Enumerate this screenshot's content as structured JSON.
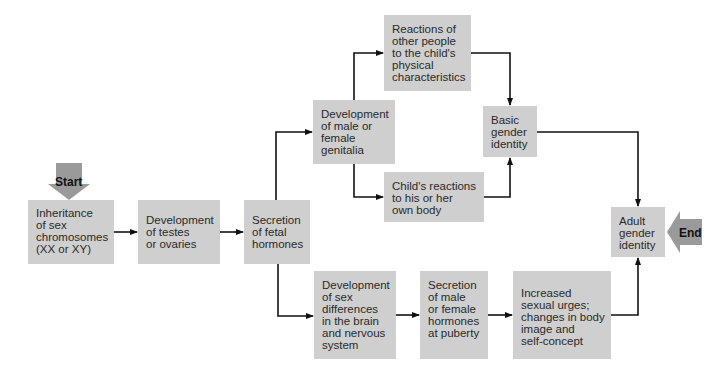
{
  "diagram": {
    "start_label": "Start",
    "end_label": "End",
    "colors": {
      "box_fill": "#cfcfcf",
      "arrow_fill": "#9a9a9a",
      "line": "#111111"
    },
    "nodes": {
      "inheritance": "Inheritance\nof sex\nchromosomes\n(XX or XY)",
      "testes_ovaries": "Development\nof testes\nor ovaries",
      "fetal_hormones": "Secretion\nof  fetal\nhormones",
      "genitalia": "Development\nof male or\nfemale\ngenitalia",
      "reactions_others": "Reactions of\nother people\nto the child's\nphysical\ncharacteristics",
      "child_reactions": "Child's reactions\nto his or her\nown body",
      "basic_identity": "Basic\ngender\nidentity",
      "adult_identity": "Adult\ngender\nidentity",
      "brain_differences": "Development\nof sex\ndifferences\nin the brain\nand nervous\nsystem",
      "puberty_hormones": "Secretion\nof male\nor female\nhormones\nat puberty",
      "sexual_urges": "Increased\nsexual urges;\nchanges in body\nimage and\nself-concept"
    },
    "edges": [
      [
        "inheritance",
        "testes_ovaries"
      ],
      [
        "testes_ovaries",
        "fetal_hormones"
      ],
      [
        "fetal_hormones",
        "genitalia"
      ],
      [
        "fetal_hormones",
        "brain_differences"
      ],
      [
        "genitalia",
        "reactions_others"
      ],
      [
        "genitalia",
        "child_reactions"
      ],
      [
        "reactions_others",
        "basic_identity"
      ],
      [
        "child_reactions",
        "basic_identity"
      ],
      [
        "basic_identity",
        "adult_identity"
      ],
      [
        "brain_differences",
        "puberty_hormones"
      ],
      [
        "puberty_hormones",
        "sexual_urges"
      ],
      [
        "sexual_urges",
        "adult_identity"
      ]
    ]
  }
}
